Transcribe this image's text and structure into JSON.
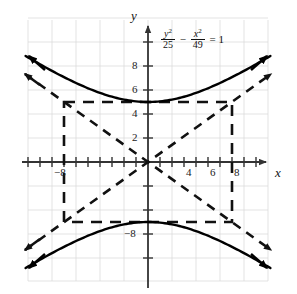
{
  "figure": {
    "equation": {
      "y_num": "y",
      "y_num_sup": "2",
      "y_den": "25",
      "minus": "−",
      "x_num": "x",
      "x_num_sup": "2",
      "x_den": "49",
      "equals": "= 1"
    },
    "axis_labels": {
      "x": "x",
      "y": "y"
    },
    "tick_labels": {
      "y_positive": [
        "8",
        "6",
        "4",
        "2"
      ],
      "y_negative": [
        "−8"
      ],
      "x_positive": [
        "4",
        "6",
        "8"
      ],
      "x_negative": [
        "−8"
      ]
    },
    "colors": {
      "curve": "#000000",
      "axis": "#333333",
      "grid": "#d9d9d9",
      "asymptote": "#111111",
      "background": "#ffffff"
    }
  },
  "chart_data": {
    "type": "line",
    "title": "",
    "subtitle": "",
    "xlabel": "x",
    "ylabel": "y",
    "annotations": [
      "y²/25 − x²/49 = 1"
    ],
    "grid": true,
    "legend": "none",
    "xlim": [
      -10.25,
      10.25
    ],
    "ylim": [
      -11.8,
      11.8
    ],
    "x_ticks": [
      -10,
      -9,
      -8,
      -7,
      -6,
      -5,
      -4,
      -3,
      -2,
      -1,
      1,
      2,
      3,
      4,
      5,
      6,
      7,
      8,
      9,
      10
    ],
    "x_tick_labels": {
      "-8": "−8",
      "4": "4",
      "6": "6",
      "8": "8"
    },
    "y_ticks": [
      -10,
      -8,
      -6,
      -4,
      -2,
      2,
      4,
      6,
      8,
      10
    ],
    "y_tick_labels": {
      "8": "8",
      "6": "6",
      "4": "4",
      "2": "2",
      "-8": "−8"
    },
    "grid_spacing": 2,
    "conic": {
      "kind": "hyperbola",
      "orientation": "vertical",
      "equation": "y^2/25 - x^2/49 = 1",
      "a": 5,
      "b": 7,
      "center": [
        0,
        0
      ],
      "vertices": [
        [
          0,
          5
        ],
        [
          0,
          -5
        ]
      ],
      "asymptote_slopes": [
        0.7142857,
        -0.7142857
      ],
      "asymptotes": [
        "y = (5/7)x",
        "y = -(5/7)x"
      ],
      "fundamental_rectangle": {
        "x": [
          -7,
          7
        ],
        "y": [
          -5,
          5
        ]
      }
    },
    "series": [
      {
        "name": "upper branch",
        "style": "solid",
        "x": [
          -10,
          -9,
          -8,
          -7,
          -6,
          -5,
          -4,
          -3,
          -2,
          -1,
          0,
          1,
          2,
          3,
          4,
          5,
          6,
          7,
          8,
          9,
          10
        ],
        "y": [
          8.99,
          8.44,
          7.93,
          7.45,
          7.01,
          6.62,
          6.27,
          5.97,
          5.72,
          5.52,
          5.0,
          5.52,
          5.72,
          5.97,
          6.27,
          6.62,
          7.01,
          7.45,
          7.93,
          8.44,
          8.99
        ]
      },
      {
        "name": "lower branch",
        "style": "solid",
        "x": [
          -10,
          -9,
          -8,
          -7,
          -6,
          -5,
          -4,
          -3,
          -2,
          -1,
          0,
          1,
          2,
          3,
          4,
          5,
          6,
          7,
          8,
          9,
          10
        ],
        "y": [
          -8.99,
          -8.44,
          -7.93,
          -7.45,
          -7.01,
          -6.62,
          -6.27,
          -5.97,
          -5.72,
          -5.52,
          -5.0,
          -5.52,
          -5.72,
          -5.97,
          -6.27,
          -6.62,
          -7.01,
          -7.45,
          -7.93,
          -8.44,
          -8.99
        ]
      },
      {
        "name": "asymptote positive slope",
        "style": "dashed",
        "x": [
          -10.2,
          10.2
        ],
        "y": [
          -7.29,
          7.29
        ]
      },
      {
        "name": "asymptote negative slope",
        "style": "dashed",
        "x": [
          -10.2,
          10.2
        ],
        "y": [
          7.29,
          -7.29
        ]
      },
      {
        "name": "fundamental rectangle",
        "style": "dashed",
        "x": [
          -7,
          7,
          7,
          -7,
          -7
        ],
        "y": [
          5,
          5,
          -5,
          -5,
          5
        ]
      }
    ]
  }
}
